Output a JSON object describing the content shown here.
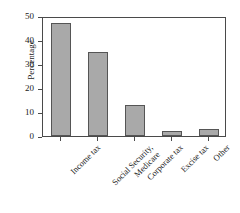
{
  "chart_data": {
    "type": "bar",
    "title": "",
    "subtitle": "",
    "xlabel": "",
    "ylabel": "Percentage",
    "categories": [
      "Income tax",
      "Social Security, Medicare",
      "Corporate tax",
      "Excise tax",
      "Other"
    ],
    "category_lines": [
      [
        "Income tax"
      ],
      [
        "Social Security,",
        "Medicare"
      ],
      [
        "Corporate tax"
      ],
      [
        "Excise tax"
      ],
      [
        "Other"
      ]
    ],
    "values": [
      47,
      35,
      13,
      2,
      3
    ],
    "ylim": [
      0,
      50
    ],
    "yticks": [
      0,
      10,
      20,
      30,
      40,
      50
    ],
    "ytick_labels": [
      "0",
      "10",
      "20",
      "30",
      "40",
      "50"
    ],
    "grid": false,
    "legend": null,
    "bar_fill_color": "#a9a9a9",
    "bar_edge_color": "#555555",
    "axis_color": "#4a4a4a",
    "background_color": "#ffffff",
    "annotations": []
  }
}
